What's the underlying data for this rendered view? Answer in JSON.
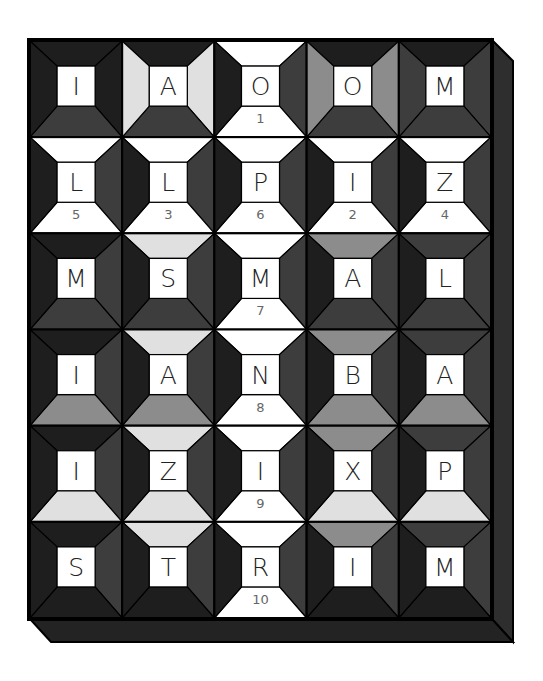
{
  "puzzle": {
    "title": "Letter tile quilt puzzle",
    "rows": 6,
    "cols": 5,
    "colors": {
      "B": "#1e1e1e",
      "D": "#3d3d3d",
      "M": "#8c8c8c",
      "L": "#e0e0e0",
      "W": "#ffffff",
      "frame": "#141414",
      "extrude_side": "#2e2e2e",
      "extrude_bottom": "#232323",
      "line": "#000000",
      "number": "#666666"
    },
    "tiles": [
      [
        {
          "letter": "I",
          "number": "",
          "top": "B",
          "right": "B",
          "bottom": "D",
          "left": "B"
        },
        {
          "letter": "A",
          "number": "",
          "top": "B",
          "right": "L",
          "bottom": "D",
          "left": "L"
        },
        {
          "letter": "O",
          "number": "1",
          "top": "W",
          "right": "D",
          "bottom": "W",
          "left": "B"
        },
        {
          "letter": "O",
          "number": "",
          "top": "B",
          "right": "M",
          "bottom": "D",
          "left": "M"
        },
        {
          "letter": "M",
          "number": "",
          "top": "B",
          "right": "D",
          "bottom": "D",
          "left": "D"
        }
      ],
      [
        {
          "letter": "L",
          "number": "5",
          "top": "W",
          "right": "D",
          "bottom": "W",
          "left": "B"
        },
        {
          "letter": "L",
          "number": "3",
          "top": "W",
          "right": "D",
          "bottom": "W",
          "left": "B"
        },
        {
          "letter": "P",
          "number": "6",
          "top": "W",
          "right": "D",
          "bottom": "W",
          "left": "B"
        },
        {
          "letter": "I",
          "number": "2",
          "top": "W",
          "right": "D",
          "bottom": "W",
          "left": "B"
        },
        {
          "letter": "Z",
          "number": "4",
          "top": "W",
          "right": "D",
          "bottom": "W",
          "left": "B"
        }
      ],
      [
        {
          "letter": "M",
          "number": "",
          "top": "B",
          "right": "D",
          "bottom": "D",
          "left": "B"
        },
        {
          "letter": "S",
          "number": "",
          "top": "L",
          "right": "D",
          "bottom": "D",
          "left": "B"
        },
        {
          "letter": "M",
          "number": "7",
          "top": "W",
          "right": "D",
          "bottom": "W",
          "left": "B"
        },
        {
          "letter": "A",
          "number": "",
          "top": "M",
          "right": "D",
          "bottom": "D",
          "left": "B"
        },
        {
          "letter": "L",
          "number": "",
          "top": "D",
          "right": "D",
          "bottom": "D",
          "left": "B"
        }
      ],
      [
        {
          "letter": "I",
          "number": "",
          "top": "B",
          "right": "D",
          "bottom": "M",
          "left": "B"
        },
        {
          "letter": "A",
          "number": "",
          "top": "L",
          "right": "D",
          "bottom": "M",
          "left": "B"
        },
        {
          "letter": "N",
          "number": "8",
          "top": "W",
          "right": "D",
          "bottom": "W",
          "left": "B"
        },
        {
          "letter": "B",
          "number": "",
          "top": "M",
          "right": "D",
          "bottom": "M",
          "left": "B"
        },
        {
          "letter": "A",
          "number": "",
          "top": "D",
          "right": "D",
          "bottom": "M",
          "left": "B"
        }
      ],
      [
        {
          "letter": "I",
          "number": "",
          "top": "B",
          "right": "D",
          "bottom": "L",
          "left": "B"
        },
        {
          "letter": "Z",
          "number": "",
          "top": "L",
          "right": "D",
          "bottom": "L",
          "left": "B"
        },
        {
          "letter": "I",
          "number": "9",
          "top": "W",
          "right": "D",
          "bottom": "W",
          "left": "B"
        },
        {
          "letter": "X",
          "number": "",
          "top": "M",
          "right": "D",
          "bottom": "L",
          "left": "B"
        },
        {
          "letter": "P",
          "number": "",
          "top": "D",
          "right": "D",
          "bottom": "L",
          "left": "B"
        }
      ],
      [
        {
          "letter": "S",
          "number": "",
          "top": "B",
          "right": "D",
          "bottom": "B",
          "left": "B"
        },
        {
          "letter": "T",
          "number": "",
          "top": "L",
          "right": "D",
          "bottom": "B",
          "left": "B"
        },
        {
          "letter": "R",
          "number": "10",
          "top": "W",
          "right": "D",
          "bottom": "W",
          "left": "B"
        },
        {
          "letter": "I",
          "number": "",
          "top": "M",
          "right": "D",
          "bottom": "B",
          "left": "B"
        },
        {
          "letter": "M",
          "number": "",
          "top": "D",
          "right": "D",
          "bottom": "B",
          "left": "B"
        }
      ]
    ]
  }
}
